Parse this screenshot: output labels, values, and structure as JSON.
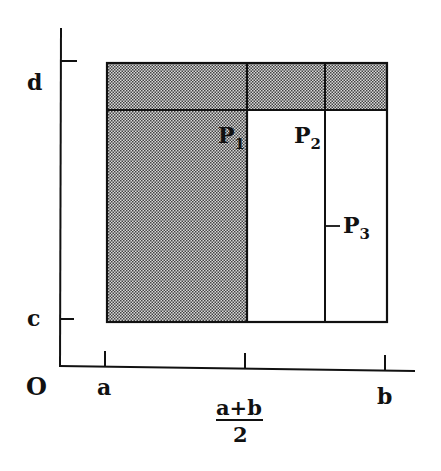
{
  "diagram": {
    "type": "region-partition",
    "axes": {
      "origin_label": "O",
      "x_ticks": [
        {
          "label": "a",
          "x": 105
        },
        {
          "label_numerator": "a+b",
          "label_denominator": "2",
          "x": 245
        },
        {
          "label": "b",
          "x": 385
        }
      ],
      "y_ticks": [
        {
          "label": "d",
          "y": 61
        },
        {
          "label": "c",
          "y": 319
        }
      ]
    },
    "regions": [
      {
        "name": "P1",
        "label": "P",
        "subscript": "1",
        "shaded": true
      },
      {
        "name": "P2",
        "label": "P",
        "subscript": "2",
        "shaded": false
      },
      {
        "name": "P3",
        "label": "P",
        "subscript": "3",
        "shaded": false
      }
    ],
    "colors": {
      "line": "#111111",
      "shade_dark": "#555555",
      "shade_light": "#d8d8d8",
      "background": "#ffffff"
    }
  },
  "labels": {
    "origin": "O",
    "x_a": "a",
    "x_mid_num": "a+b",
    "x_mid_den": "2",
    "x_b": "b",
    "y_d": "d",
    "y_c": "c",
    "p1": "P",
    "p1_sub": "1",
    "p2": "P",
    "p2_sub": "2",
    "p3": "P",
    "p3_sub": "3"
  }
}
